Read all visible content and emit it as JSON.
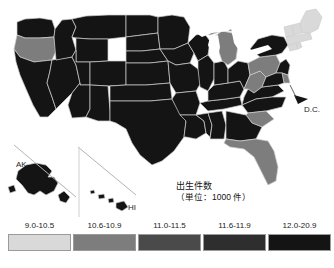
{
  "top_fragment": "                                                  ",
  "map": {
    "title_line1": "出生件数",
    "title_line2": "（単位：1000 件）",
    "inset_labels": {
      "alaska": "AK",
      "hawaii": "HI",
      "dc": "D.C."
    }
  },
  "legend": {
    "items": [
      {
        "label": "9.0-10.5",
        "color": "#d9d9d9"
      },
      {
        "label": "10.6-10.9",
        "color": "#7d7d7d"
      },
      {
        "label": "11.0-11.5",
        "color": "#4a4a4a"
      },
      {
        "label": "11.6-11.9",
        "color": "#2e2e2e"
      },
      {
        "label": "12.0-20.9",
        "color": "#141414"
      }
    ]
  },
  "chart_data": {
    "type": "choropleth-map",
    "legend_title": "出生件数（単位：1000 件）",
    "unit": "1000 件",
    "bins": [
      "9.0-10.5",
      "10.6-10.9",
      "11.0-11.5",
      "11.6-11.9",
      "12.0-20.9"
    ],
    "bin_colors": [
      "#d9d9d9",
      "#7d7d7d",
      "#4a4a4a",
      "#2e2e2e",
      "#141414"
    ],
    "regions": [
      {
        "code": "WA",
        "bin": 4
      },
      {
        "code": "OR",
        "bin": 1
      },
      {
        "code": "CA",
        "bin": 4
      },
      {
        "code": "NV",
        "bin": 4
      },
      {
        "code": "ID",
        "bin": 4
      },
      {
        "code": "MT",
        "bin": 4
      },
      {
        "code": "WY",
        "bin": 4
      },
      {
        "code": "UT",
        "bin": 4
      },
      {
        "code": "AZ",
        "bin": 4
      },
      {
        "code": "CO",
        "bin": 4
      },
      {
        "code": "NM",
        "bin": 4
      },
      {
        "code": "ND",
        "bin": 4
      },
      {
        "code": "SD",
        "bin": 4
      },
      {
        "code": "NE",
        "bin": 4
      },
      {
        "code": "KS",
        "bin": 4
      },
      {
        "code": "OK",
        "bin": 4
      },
      {
        "code": "TX",
        "bin": 4
      },
      {
        "code": "MN",
        "bin": 4
      },
      {
        "code": "IA",
        "bin": 4
      },
      {
        "code": "MO",
        "bin": 4
      },
      {
        "code": "AR",
        "bin": 4
      },
      {
        "code": "LA",
        "bin": 4
      },
      {
        "code": "WI",
        "bin": 4
      },
      {
        "code": "IL",
        "bin": 4
      },
      {
        "code": "MS",
        "bin": 4
      },
      {
        "code": "AL",
        "bin": 4
      },
      {
        "code": "TN",
        "bin": 4
      },
      {
        "code": "KY",
        "bin": 4
      },
      {
        "code": "IN",
        "bin": 4
      },
      {
        "code": "MI",
        "bin": 1
      },
      {
        "code": "OH",
        "bin": 4
      },
      {
        "code": "WV",
        "bin": 1
      },
      {
        "code": "VA",
        "bin": 4
      },
      {
        "code": "NC",
        "bin": 4
      },
      {
        "code": "SC",
        "bin": 1
      },
      {
        "code": "GA",
        "bin": 4
      },
      {
        "code": "FL",
        "bin": 1
      },
      {
        "code": "PA",
        "bin": 1
      },
      {
        "code": "NY",
        "bin": 4
      },
      {
        "code": "NJ",
        "bin": 4
      },
      {
        "code": "MD",
        "bin": 4
      },
      {
        "code": "DE",
        "bin": 1
      },
      {
        "code": "CT",
        "bin": 0
      },
      {
        "code": "RI",
        "bin": 0
      },
      {
        "code": "MA",
        "bin": 0
      },
      {
        "code": "VT",
        "bin": 0
      },
      {
        "code": "NH",
        "bin": 0
      },
      {
        "code": "ME",
        "bin": 0
      },
      {
        "code": "AK",
        "bin": 4
      },
      {
        "code": "HI",
        "bin": 4
      },
      {
        "code": "DC",
        "bin": 4
      }
    ]
  }
}
